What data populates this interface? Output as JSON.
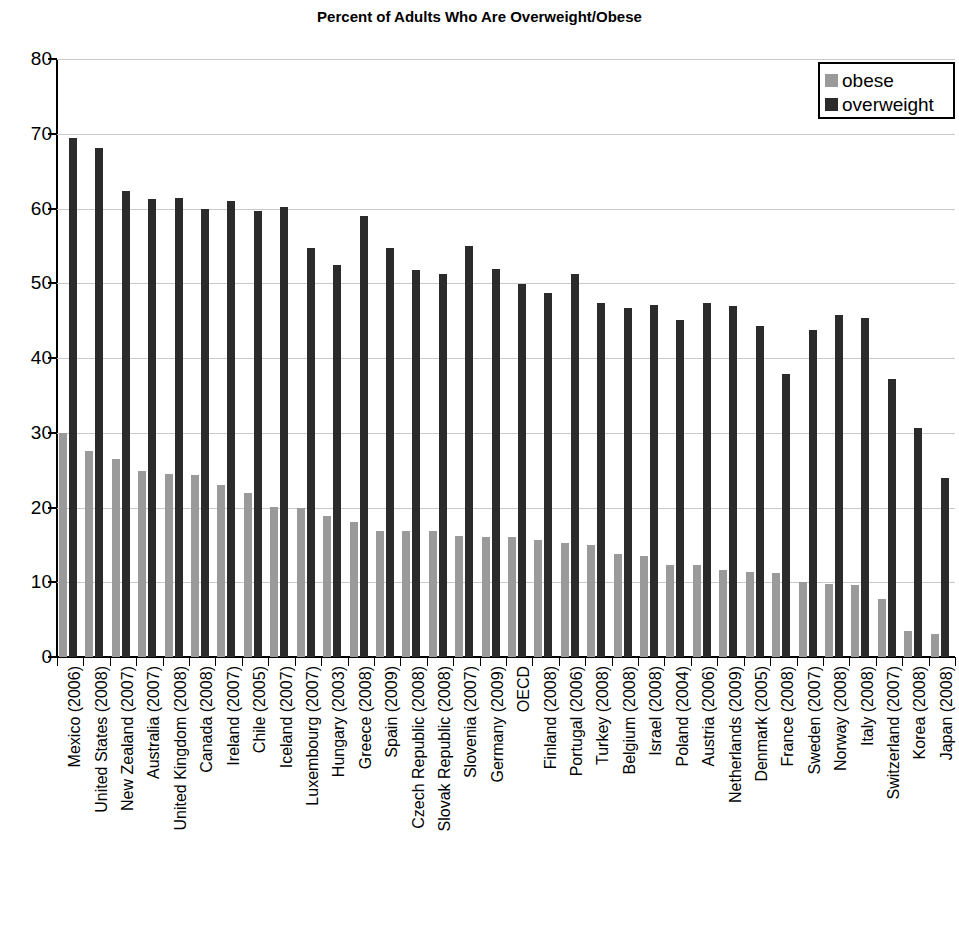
{
  "chart_data": {
    "type": "bar",
    "title": "Percent of Adults Who Are Overweight/Obese",
    "xlabel": "",
    "ylabel": "",
    "ylim": [
      0,
      80
    ],
    "ytick_labels": [
      "80",
      "70",
      "60",
      "50",
      "40",
      "30",
      "20",
      "10",
      "0"
    ],
    "ytick_values": [
      80,
      70,
      60,
      50,
      40,
      30,
      20,
      10,
      0
    ],
    "grid": true,
    "legend_position": "top-right",
    "categories": [
      "Mexico (2006)",
      "United States (2008)",
      "New Zealand (2007)",
      "Australia (2007)",
      "United Kingdom (2008)",
      "Canada (2008)",
      "Ireland (2007)",
      "Chile (2005)",
      "Iceland (2007)",
      "Luxembourg (2007)",
      "Hungary (2003)",
      "Greece (2008)",
      "Spain (2009)",
      "Czech Republic (2008)",
      "Slovak Republic (2008)",
      "Slovenia (2007)",
      "Germany (2009)",
      "OECD",
      "Finland (2008)",
      "Portugal (2006)",
      "Turkey (2008)",
      "Belgium (2008)",
      "Israel (2008)",
      "Poland (2004)",
      "Austria (2006)",
      "Netherlands (2009)",
      "Denmark (2005)",
      "France (2008)",
      "Sweden (2007)",
      "Norway (2008)",
      "Italy (2008)",
      "Switzerland (2007)",
      "Korea (2008)",
      "Japan (2008)"
    ],
    "series": [
      {
        "name": "obese",
        "color": "#9a9a9a",
        "values": [
          30.0,
          27.5,
          26.5,
          24.9,
          24.5,
          24.3,
          23.0,
          21.9,
          20.1,
          19.9,
          18.8,
          18.1,
          16.9,
          16.9,
          16.9,
          16.2,
          16.0,
          16.0,
          15.7,
          15.3,
          15.0,
          13.8,
          13.5,
          12.3,
          12.3,
          11.6,
          11.4,
          11.2,
          10.1,
          9.8,
          9.7,
          7.8,
          3.5,
          3.1
        ]
      },
      {
        "name": "overweight",
        "color": "#2b2b2b",
        "values": [
          69.5,
          68.1,
          62.4,
          61.3,
          61.4,
          59.9,
          61.0,
          59.7,
          60.2,
          54.7,
          52.5,
          59.0,
          54.7,
          51.8,
          51.2,
          55.0,
          51.9,
          49.9,
          48.7,
          51.2,
          47.4,
          46.7,
          47.1,
          45.1,
          47.3,
          46.9,
          44.3,
          37.9,
          43.8,
          45.8,
          45.3,
          37.2,
          30.6,
          24.0
        ]
      }
    ]
  },
  "legend": {
    "items": [
      {
        "label": "obese",
        "color": "#9a9a9a"
      },
      {
        "label": "overweight",
        "color": "#2b2b2b"
      }
    ]
  }
}
